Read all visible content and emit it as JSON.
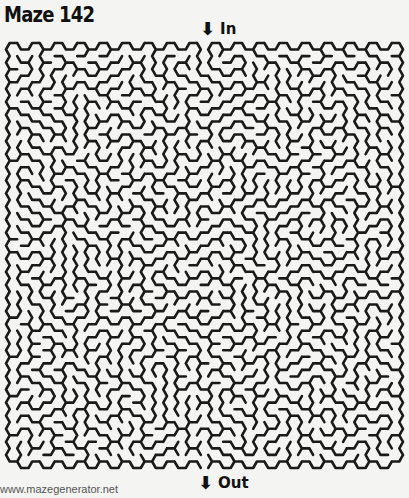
{
  "title": "Maze 142",
  "entrance": {
    "label": "In",
    "icon": "down-arrow-icon",
    "glyph": "⬇"
  },
  "exit": {
    "label": "Out",
    "icon": "down-arrow-icon",
    "glyph": "⬇"
  },
  "footer": {
    "site": "www.mazegenerator.net"
  },
  "maze": {
    "shape": "hexagonal",
    "columns": 35,
    "rows": 32,
    "wall_color": "#1a1a1a",
    "background": "#f4f4f2",
    "entrance_column": 17,
    "exit_column": 17,
    "seed": 142
  }
}
